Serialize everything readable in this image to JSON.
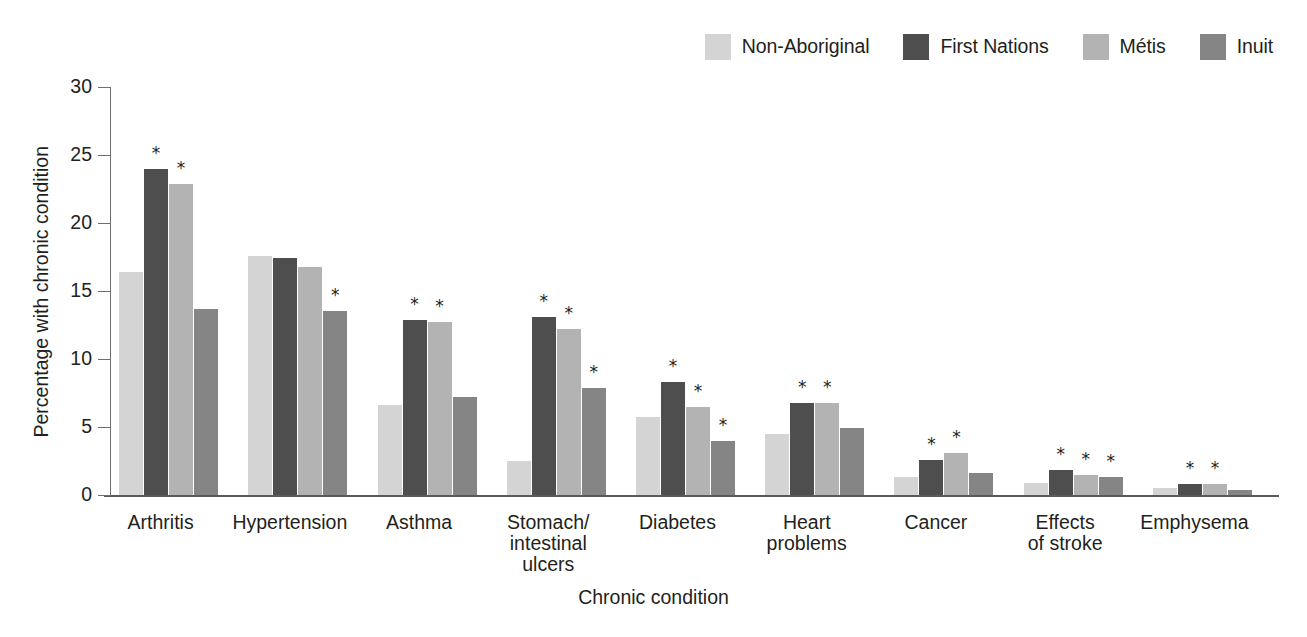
{
  "chart_data": {
    "type": "bar",
    "title": "",
    "xlabel": "Chronic condition",
    "ylabel": "Percentage with chronic condition",
    "ylim": [
      0,
      30
    ],
    "yticks": [
      0,
      5,
      10,
      15,
      20,
      25,
      30
    ],
    "ytick_labels": [
      "0",
      "5",
      "10",
      "15",
      "20",
      "25",
      "30"
    ],
    "grid": false,
    "legend_position": "top-right",
    "significance_marker": "*",
    "categories": [
      "Arthritis",
      "Hypertension",
      "Asthma",
      "Stomach/\nintestinal ulcers",
      "Diabetes",
      "Heart\nproblems",
      "Cancer",
      "Effects\nof stroke",
      "Emphysema"
    ],
    "series": [
      {
        "name": "Non-Aboriginal",
        "color": "#d4d4d4",
        "values": [
          16.4,
          17.6,
          6.6,
          2.5,
          5.7,
          4.5,
          1.3,
          0.9,
          0.5
        ],
        "significant": [
          false,
          false,
          false,
          false,
          false,
          false,
          false,
          false,
          false
        ]
      },
      {
        "name": "First Nations",
        "color": "#4e4e4e",
        "values": [
          24.0,
          17.4,
          12.9,
          13.1,
          8.3,
          6.8,
          2.6,
          1.85,
          0.8
        ],
        "significant": [
          true,
          false,
          true,
          true,
          true,
          true,
          true,
          true,
          true
        ]
      },
      {
        "name": "Métis",
        "color": "#b3b3b3",
        "values": [
          22.9,
          16.8,
          12.7,
          12.2,
          6.5,
          6.8,
          3.1,
          1.5,
          0.8
        ],
        "significant": [
          true,
          false,
          true,
          true,
          true,
          true,
          true,
          true,
          true
        ]
      },
      {
        "name": "Inuit",
        "color": "#858585",
        "values": [
          13.7,
          13.5,
          7.2,
          7.9,
          4.0,
          4.9,
          1.6,
          1.35,
          0.4
        ],
        "significant": [
          false,
          true,
          false,
          true,
          true,
          false,
          false,
          true,
          false
        ]
      }
    ]
  }
}
